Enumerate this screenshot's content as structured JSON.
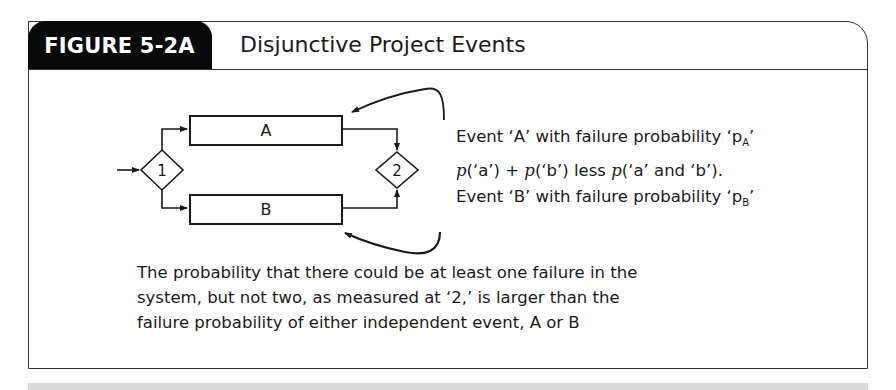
{
  "figure": {
    "label": "FIGURE 5-2A",
    "title": "Disjunctive Project Events"
  },
  "diagram": {
    "nodes": [
      {
        "id": "1",
        "type": "decision",
        "label": "1"
      },
      {
        "id": "2",
        "type": "decision",
        "label": "2"
      },
      {
        "id": "A",
        "type": "activity",
        "label": "A"
      },
      {
        "id": "B",
        "type": "activity",
        "label": "B"
      }
    ],
    "edges": [
      {
        "from": "input",
        "to": "1"
      },
      {
        "from": "1",
        "to": "A"
      },
      {
        "from": "1",
        "to": "B"
      },
      {
        "from": "A",
        "to": "2"
      },
      {
        "from": "B",
        "to": "2"
      }
    ],
    "annotations": {
      "event_a_prefix": "Event ‘A’ with failure probability ‘p",
      "event_a_sub": "A",
      "event_a_suffix": "’",
      "formula": {
        "p1": "p",
        "a1": "(‘a’) + ",
        "p2": "p",
        "b1": "(‘b’) less ",
        "p3": "p",
        "ab": "(‘a’ and ‘b’)."
      },
      "event_b_prefix": "Event ‘B’ with failure probability ‘p",
      "event_b_sub": "B",
      "event_b_suffix": "’"
    }
  },
  "caption": {
    "lines": [
      "The probability that there could be at least one failure in the",
      "system, but not two, as measured at ‘2,’ is larger than the",
      "failure probability of either independent event, A or B"
    ]
  }
}
